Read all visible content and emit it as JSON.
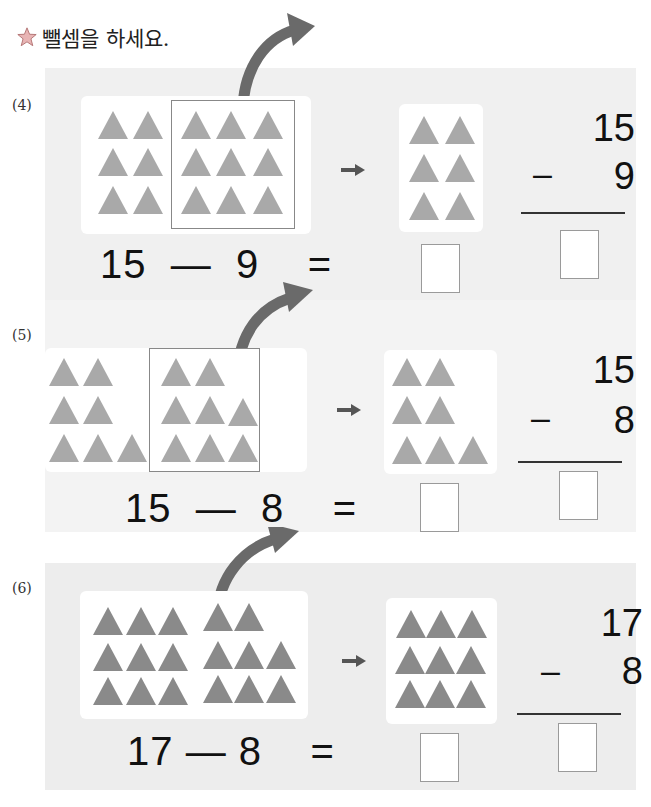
{
  "instruction": {
    "icon": "star-icon",
    "text": "뺄셈을 하세요."
  },
  "colors": {
    "panel_bg": "#f0f0f0",
    "triangle": "#a9a9a9",
    "triangle_dark": "#8a8a8a",
    "arrow": "#666666"
  },
  "problems": [
    {
      "number": "(4)",
      "equation": {
        "minuend": "15",
        "op": "—",
        "subtrahend": "9",
        "equals": "="
      },
      "vertical": {
        "top": "15",
        "op": "–",
        "bottom": "9"
      },
      "left_group_count": 6,
      "removed_group_count": 9,
      "remaining_count": 6
    },
    {
      "number": "(5)",
      "equation": {
        "minuend": "15",
        "op": "—",
        "subtrahend": "8",
        "equals": "="
      },
      "vertical": {
        "top": "15",
        "op": "–",
        "bottom": "8"
      },
      "left_group_count": 7,
      "removed_group_count": 8,
      "remaining_count": 7
    },
    {
      "number": "(6)",
      "equation": {
        "minuend": "17",
        "op": "—",
        "subtrahend": "8",
        "equals": "="
      },
      "vertical": {
        "top": "17",
        "op": "–",
        "bottom": "8"
      },
      "left_group_count": 9,
      "removed_group_count": 8,
      "remaining_count": 9
    }
  ]
}
